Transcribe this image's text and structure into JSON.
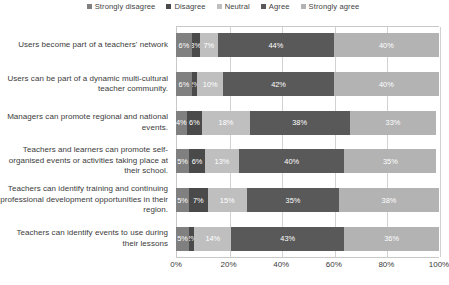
{
  "chart_data": {
    "type": "bar",
    "orientation": "horizontal",
    "stacked": true,
    "stacked_mode": "percent",
    "title": "",
    "xlabel": "",
    "ylabel": "",
    "xlim": [
      0,
      100
    ],
    "xticks": [
      "0%",
      "20%",
      "40%",
      "60%",
      "80%",
      "100%"
    ],
    "xtick_values": [
      0,
      20,
      40,
      60,
      80,
      100
    ],
    "grid": true,
    "legend_position": "top",
    "categories": [
      "Users become part of a teachers' network",
      "Users can be part of a dynamic multi-cultural teacher community.",
      "Managers can promote regional and national events.",
      "Teachers and learners can promote self-organised events or activities taking place at their school.",
      "Teachers can identify training and continuing professional development opportunities in their region.",
      "Teachers can identify events to use during their lessons"
    ],
    "series": [
      {
        "name": "Strongly disagree",
        "color": "#808080",
        "values": [
          6,
          6,
          4,
          5,
          5,
          5
        ],
        "labels": [
          "6%",
          "6%",
          "4%",
          "5%",
          "5%",
          "5%"
        ]
      },
      {
        "name": "Disagree",
        "color": "#4a4a4a",
        "values": [
          3,
          2,
          6,
          6,
          7,
          2
        ],
        "labels": [
          "3%",
          "2%",
          "6%",
          "6%",
          "7%",
          "2%"
        ]
      },
      {
        "name": "Neutral",
        "color": "#bfbfbf",
        "values": [
          7,
          10,
          18,
          13,
          15,
          14
        ],
        "labels": [
          "7%",
          "10%",
          "18%",
          "13%",
          "15%",
          "14%"
        ]
      },
      {
        "name": "Agree",
        "color": "#595959",
        "values": [
          44,
          42,
          38,
          40,
          35,
          43
        ],
        "labels": [
          "44%",
          "42%",
          "38%",
          "40%",
          "35%",
          "43%"
        ]
      },
      {
        "name": "Strongly agree",
        "color": "#b3b3b3",
        "values": [
          40,
          40,
          33,
          35,
          38,
          36
        ],
        "labels": [
          "40%",
          "40%",
          "33%",
          "35%",
          "38%",
          "36%"
        ]
      }
    ]
  },
  "legend": {
    "items": [
      {
        "label": "Strongly disagree",
        "color": "#808080"
      },
      {
        "label": "Disagree",
        "color": "#4a4a4a"
      },
      {
        "label": "Neutral",
        "color": "#bfbfbf"
      },
      {
        "label": "Agree",
        "color": "#595959"
      },
      {
        "label": "Strongly agree",
        "color": "#b3b3b3"
      }
    ]
  }
}
